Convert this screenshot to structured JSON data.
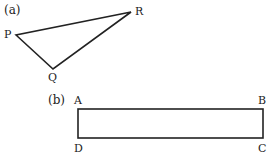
{
  "figure_a": {
    "part_label": "(a)",
    "shape": "triangle",
    "vertices": [
      {
        "name": "P",
        "x": 16,
        "y": 35
      },
      {
        "name": "Q",
        "x": 53,
        "y": 69
      },
      {
        "name": "R",
        "x": 131,
        "y": 12
      }
    ]
  },
  "figure_b": {
    "part_label": "(b)",
    "shape": "rectangle",
    "vertices": [
      {
        "name": "A",
        "x": 78,
        "y": 109
      },
      {
        "name": "B",
        "x": 263,
        "y": 109
      },
      {
        "name": "C",
        "x": 263,
        "y": 138
      },
      {
        "name": "D",
        "x": 78,
        "y": 138
      }
    ]
  },
  "colors": {
    "stroke": "#222222",
    "background": "#ffffff"
  }
}
